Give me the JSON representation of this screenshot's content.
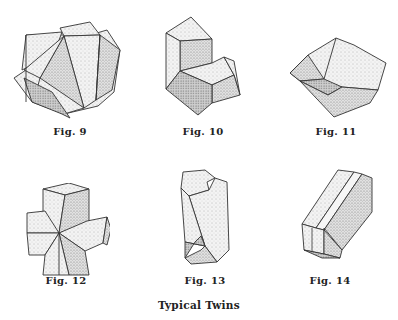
{
  "title": "Typical Twins",
  "figures": [
    {
      "id": "fig9",
      "label": "Fig. 9",
      "description": "Interpenetrating cube twin (fluorite-type)"
    },
    {
      "id": "fig10",
      "label": "Fig. 10",
      "description": "Contact twin with re-entrant angle"
    },
    {
      "id": "fig11",
      "label": "Fig. 11",
      "description": "Spinel-type contact twin"
    },
    {
      "id": "fig12",
      "label": "Fig. 12",
      "description": "Cruciform penetration twin (staurolite-type)"
    },
    {
      "id": "fig13",
      "label": "Fig. 13",
      "description": "Prismatic twin with notched ends (swallowtail)"
    },
    {
      "id": "fig14",
      "label": "Fig. 14",
      "description": "Polysynthetic prismatic twin with striations"
    }
  ],
  "colors": {
    "background": "#ffffff",
    "line": "#333333",
    "light": "#ececec",
    "mid": "#d6d6d6",
    "dark": "#bdbdbd",
    "text": "#222222"
  }
}
